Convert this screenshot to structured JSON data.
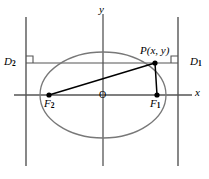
{
  "figure": {
    "colors": {
      "stroke": "#555555",
      "curve": "#707070",
      "focal_line": "#000000",
      "text": "#000000",
      "background": "#ffffff"
    },
    "axes": {
      "x_label": "x",
      "y_label": "y",
      "origin_label": "O"
    },
    "points": [
      {
        "id": "P",
        "label": "P(x, y)",
        "name_part": "P",
        "coords_part": "(x, y)",
        "x": 155,
        "y": 63
      },
      {
        "id": "F1",
        "label": "F",
        "subscript": "1",
        "x": 157,
        "y": 95
      },
      {
        "id": "F2",
        "label": "F",
        "subscript": "2",
        "x": 49,
        "y": 95
      }
    ],
    "directrices": [
      {
        "id": "D1",
        "label": "D",
        "subscript": "1",
        "position": "right",
        "x": 178
      },
      {
        "id": "D2",
        "label": "D",
        "subscript": "2",
        "position": "left",
        "x": 26
      }
    ],
    "ellipse": {
      "center_x": 103,
      "center_y": 95,
      "semi_major": 63,
      "semi_minor": 43
    },
    "right_angle_markers": 2,
    "segments": [
      {
        "from": "F2",
        "to": "P"
      },
      {
        "from": "F1",
        "to": "P"
      },
      {
        "from": "D2",
        "to": "D1",
        "kind": "horizontal-directrix-chord"
      }
    ]
  }
}
